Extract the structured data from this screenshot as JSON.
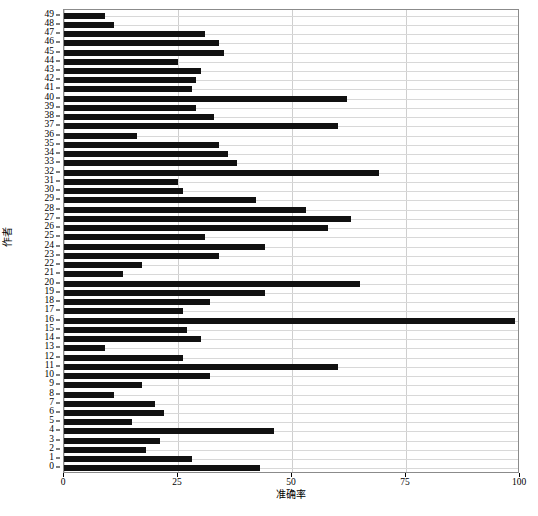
{
  "chart_data": {
    "type": "bar",
    "orientation": "horizontal",
    "title": "",
    "xlabel": "准确率",
    "ylabel": "作者",
    "xlim": [
      0,
      100
    ],
    "ylim": [
      -0.6,
      49.6
    ],
    "grid": true,
    "grid_axis": "both",
    "legend": null,
    "bar_color": "#111111",
    "xticks": [
      0,
      25,
      50,
      75,
      100
    ],
    "xtick_labels": [
      "0",
      "25",
      "50",
      "75",
      "100"
    ],
    "categories": [
      "0",
      "1",
      "2",
      "3",
      "4",
      "5",
      "6",
      "7",
      "8",
      "9",
      "10",
      "11",
      "12",
      "13",
      "14",
      "15",
      "16",
      "17",
      "18",
      "19",
      "20",
      "21",
      "22",
      "23",
      "24",
      "25",
      "26",
      "27",
      "28",
      "29",
      "30",
      "31",
      "32",
      "33",
      "34",
      "35",
      "36",
      "37",
      "38",
      "39",
      "40",
      "41",
      "42",
      "43",
      "44",
      "45",
      "46",
      "47",
      "48",
      "49"
    ],
    "values": [
      43,
      28,
      18,
      21,
      46,
      15,
      22,
      20,
      11,
      17,
      32,
      60,
      26,
      9,
      30,
      27,
      99,
      26,
      32,
      44,
      65,
      13,
      17,
      34,
      44,
      31,
      58,
      63,
      53,
      42,
      26,
      25,
      69,
      38,
      36,
      34,
      16,
      60,
      33,
      29,
      62,
      28,
      29,
      30,
      25,
      35,
      34,
      31,
      11,
      9
    ],
    "value_axis_label": "准确率",
    "category_axis_label": "作者"
  }
}
